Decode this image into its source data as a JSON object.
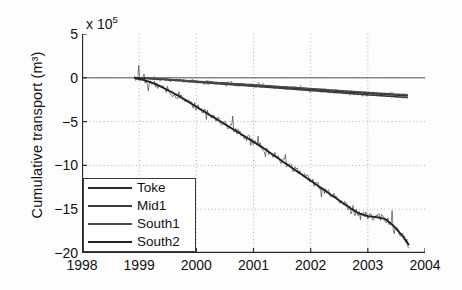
{
  "chart_data": {
    "type": "line",
    "title": "",
    "xlabel": "",
    "ylabel": "Cumulative transport (m³)",
    "y_multiplier": "x 10",
    "y_multiplier_exp": "5",
    "xlim": [
      1998,
      2004
    ],
    "ylim": [
      -20,
      5
    ],
    "xticks": [
      "1998",
      "1999",
      "2000",
      "2001",
      "2002",
      "2003",
      "2004"
    ],
    "yticks": [
      "5",
      "0",
      "-5",
      "-10",
      "-15",
      "-20"
    ],
    "grid": true,
    "legend_position": "lower left",
    "series": [
      {
        "name": "Toke",
        "color": "#2b2b2b",
        "x": [
          1998.92,
          1999.1,
          1999.3,
          1999.5,
          1999.75,
          2000.0,
          2000.3,
          2000.6,
          2001.0,
          2001.4,
          2001.8,
          2002.2,
          2002.6,
          2003.0,
          2003.35,
          2003.7
        ],
        "y": [
          0.0,
          -0.05,
          -0.12,
          -0.2,
          -0.3,
          -0.42,
          -0.55,
          -0.68,
          -0.85,
          -1.05,
          -1.22,
          -1.42,
          -1.6,
          -1.78,
          -1.92,
          -2.05
        ]
      },
      {
        "name": "Mid1",
        "color": "#3a3a3a",
        "x": [
          1998.92,
          1999.1,
          1999.3,
          1999.5,
          1999.75,
          2000.0,
          2000.3,
          2000.6,
          2001.0,
          2001.4,
          2001.8,
          2002.2,
          2002.6,
          2003.0,
          2003.35,
          2003.7
        ],
        "y": [
          0.0,
          -0.06,
          -0.14,
          -0.24,
          -0.36,
          -0.5,
          -0.64,
          -0.78,
          -0.96,
          -1.16,
          -1.35,
          -1.55,
          -1.75,
          -1.95,
          -2.1,
          -2.25
        ]
      },
      {
        "name": "South1",
        "color": "#4a4a4a",
        "x": [
          1998.92,
          1999.1,
          1999.3,
          1999.5,
          1999.75,
          2000.0,
          2000.3,
          2000.6,
          2001.0,
          2001.4,
          2001.8,
          2002.2,
          2002.6,
          2003.0,
          2003.35,
          2003.7
        ],
        "y": [
          0.0,
          -0.04,
          -0.1,
          -0.18,
          -0.28,
          -0.4,
          -0.52,
          -0.64,
          -0.8,
          -0.98,
          -1.14,
          -1.32,
          -1.5,
          -1.68,
          -1.82,
          -1.95
        ]
      },
      {
        "name": "South2",
        "color": "#222222",
        "x": [
          1998.92,
          1999.05,
          1999.2,
          1999.35,
          1999.5,
          1999.7,
          1999.9,
          2000.1,
          2000.3,
          2000.5,
          2000.7,
          2000.9,
          2001.1,
          2001.3,
          2001.5,
          2001.7,
          2001.9,
          2002.1,
          2002.3,
          2002.5,
          2002.7,
          2002.85,
          2003.0,
          2003.15,
          2003.3,
          2003.45,
          2003.6,
          2003.72
        ],
        "y": [
          0.0,
          -0.2,
          -0.5,
          -0.9,
          -1.4,
          -2.1,
          -2.9,
          -3.7,
          -4.5,
          -5.3,
          -6.1,
          -6.9,
          -7.7,
          -8.6,
          -9.5,
          -10.4,
          -11.3,
          -12.2,
          -13.1,
          -14.0,
          -14.9,
          -15.5,
          -15.8,
          -15.9,
          -16.1,
          -16.9,
          -18.0,
          -19.1
        ]
      }
    ]
  },
  "legend": {
    "items": [
      {
        "label": "Toke"
      },
      {
        "label": "Mid1"
      },
      {
        "label": "South1"
      },
      {
        "label": "South2"
      }
    ]
  }
}
